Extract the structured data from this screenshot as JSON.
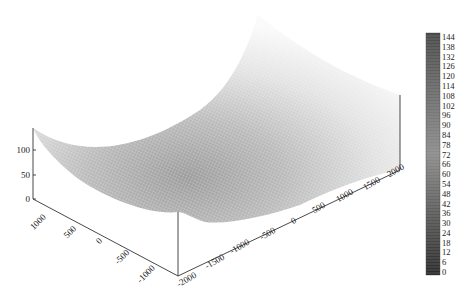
{
  "chart_data": {
    "type": "surface3d",
    "title": "",
    "x_axis": {
      "label": "",
      "ticks": [
        -2000,
        -1500,
        -1000,
        -500,
        0,
        500,
        1000,
        1500,
        2000
      ],
      "tick_labels": [
        "-2000",
        "-1500",
        "-1000",
        "-500",
        "0",
        "500",
        "1000",
        "1500",
        "2000"
      ],
      "range": [
        -2000,
        2000
      ]
    },
    "y_axis": {
      "label": "",
      "ticks": [
        1000,
        500,
        0,
        -500,
        -1000
      ],
      "tick_labels": [
        "1000",
        "500",
        "0",
        "-500",
        "-1000"
      ],
      "range": [
        -1200,
        1200
      ]
    },
    "z_axis": {
      "label": "",
      "ticks": [
        0,
        50,
        100
      ],
      "tick_labels": [
        "0",
        "50",
        "100"
      ],
      "range": [
        0,
        144
      ]
    },
    "surface": {
      "shape": "bowl (quadratic minimum near center, rising toward corners)",
      "z_min": 0,
      "z_max": 144,
      "corner_values_approx": {
        "x=-2000,y=1200": 120,
        "x=2000,y=1200": 144,
        "x=2000,y=-1200": 100,
        "x=-2000,y=-1200": 40
      }
    },
    "colorbar": {
      "ticks": [
        0,
        6,
        12,
        18,
        24,
        30,
        36,
        42,
        48,
        54,
        60,
        66,
        72,
        78,
        84,
        90,
        96,
        102,
        108,
        114,
        120,
        126,
        132,
        138,
        144
      ],
      "tick_labels": [
        "0",
        "6",
        "12",
        "18",
        "24",
        "30",
        "36",
        "42",
        "48",
        "54",
        "60",
        "66",
        "72",
        "78",
        "84",
        "90",
        "96",
        "102",
        "108",
        "114",
        "120",
        "126",
        "132",
        "138",
        "144"
      ],
      "colormap": "gray",
      "position": "right"
    },
    "grid": false,
    "legend": null
  },
  "colors": {
    "axis": "#333333",
    "colorbar_dark": "#2b2b2b",
    "colorbar_light": "#9a9a9a",
    "mesh_low": "#8a8a8a",
    "mesh_high": "#f4f4f4"
  }
}
